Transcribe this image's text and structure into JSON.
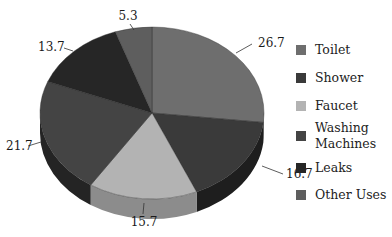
{
  "chart_data": {
    "type": "pie",
    "title": "",
    "categories": [
      "Toilet",
      "Shower",
      "Faucet",
      "Washing Machines",
      "Leaks",
      "Other Uses"
    ],
    "values": [
      26.7,
      16.7,
      15.7,
      21.7,
      13.7,
      5.3
    ],
    "colors": [
      "#6e6e6e",
      "#3a3a3a",
      "#b3b3b3",
      "#444444",
      "#262626",
      "#5e5e5e"
    ],
    "side_colors": [
      "#505050",
      "#1e1e1e",
      "#8c8c8c",
      "#242424",
      "#141414",
      "#444444"
    ],
    "data_labels": [
      "26.7",
      "16.7",
      "15.7",
      "21.7",
      "13.7",
      "5.3"
    ],
    "style": "3d-tilted",
    "legend_position": "right"
  },
  "legend": {
    "items": [
      {
        "label": "Toilet",
        "color": "#6e6e6e",
        "top": 0
      },
      {
        "label": "Shower",
        "color": "#3a3a3a",
        "top": 28
      },
      {
        "label": "Faucet",
        "color": "#b3b3b3",
        "top": 56
      },
      {
        "label": "Washing Machines",
        "line1": "Washing",
        "line2": "Machines",
        "color": "#444444",
        "top": 84
      },
      {
        "label": "Leaks",
        "color": "#262626",
        "top": 118
      },
      {
        "label": "Other Uses",
        "color": "#5e5e5e",
        "top": 145
      }
    ]
  }
}
